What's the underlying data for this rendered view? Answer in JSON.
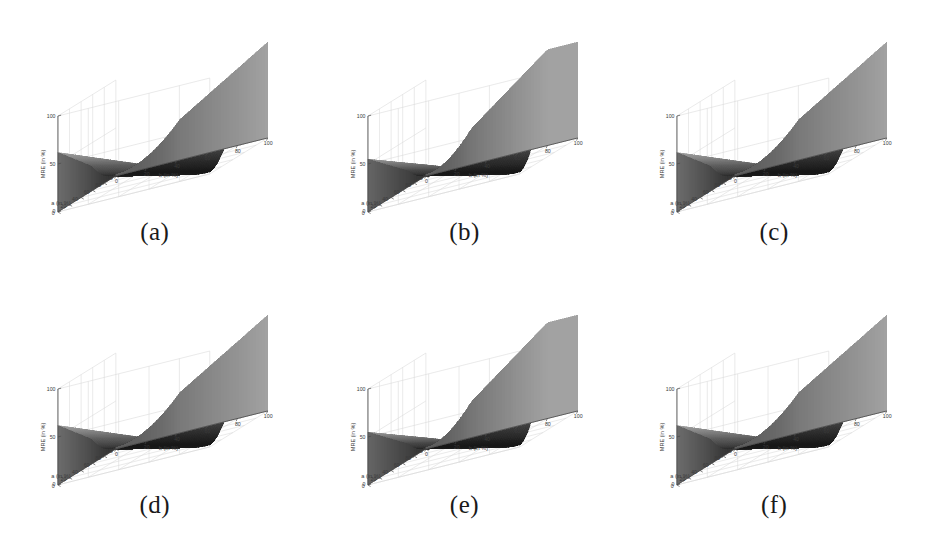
{
  "figure": {
    "background_color": "#ffffff",
    "panel_count": 6,
    "rows": 2,
    "columns": 3
  },
  "axes": {
    "z_label": "MRE (in %)",
    "x_label": "a (in %)",
    "y_label": "b (in %)",
    "z_ticks": [
      "0",
      "50",
      "100"
    ],
    "x_ticks": [
      "0",
      "20",
      "40",
      "60",
      "80",
      "100"
    ],
    "y_ticks": [
      "0",
      "20",
      "40",
      "60",
      "80",
      "100"
    ],
    "grid_color": "#d8d8d8",
    "axis_color": "#4a4a4a"
  },
  "panels": [
    {
      "caption": "(a)",
      "shape": "single-valley"
    },
    {
      "caption": "(b)",
      "shape": "v-valley-ridge"
    },
    {
      "caption": "(c)",
      "shape": "single-valley"
    },
    {
      "caption": "(d)",
      "shape": "single-valley"
    },
    {
      "caption": "(e)",
      "shape": "v-valley-ridge"
    },
    {
      "caption": "(f)",
      "shape": "single-valley"
    }
  ],
  "chart_data": {
    "type": "surface",
    "title": "",
    "xlabel": "a (in %)",
    "ylabel": "b (in %)",
    "zlabel": "MRE (in %)",
    "xlim": [
      0,
      100
    ],
    "ylim": [
      0,
      100
    ],
    "zlim": [
      0,
      100
    ],
    "grid": true,
    "legend": "none",
    "colormap": "grayscale",
    "series": [
      {
        "name": "(a)",
        "shape": "single-valley",
        "z_at_corners": {
          "a0_b0": 100,
          "a0_b100": 45,
          "a100_b0": 0,
          "a100_b100": 55
        },
        "valley_line": "a approximately equals b, MRE near 0"
      },
      {
        "name": "(b)",
        "shape": "v-valley-ridge",
        "z_at_corners": {
          "a0_b0": 100,
          "a0_b100": 100,
          "a100_b0": 0,
          "a100_b100": 45
        },
        "valley_line": "steep V-shaped trough along a approximately equals b with a high ridge at large b"
      },
      {
        "name": "(c)",
        "shape": "single-valley",
        "z_at_corners": {
          "a0_b0": 100,
          "a0_b100": 45,
          "a100_b0": 0,
          "a100_b100": 55
        },
        "valley_line": "a approximately equals b, MRE near 0"
      },
      {
        "name": "(d)",
        "shape": "single-valley",
        "z_at_corners": {
          "a0_b0": 100,
          "a0_b100": 45,
          "a100_b0": 0,
          "a100_b100": 55
        },
        "valley_line": "a approximately equals b, MRE near 0"
      },
      {
        "name": "(e)",
        "shape": "v-valley-ridge",
        "z_at_corners": {
          "a0_b0": 100,
          "a0_b100": 100,
          "a100_b0": 0,
          "a100_b100": 45
        },
        "valley_line": "steep V-shaped trough along a approximately equals b with a high ridge at large b"
      },
      {
        "name": "(f)",
        "shape": "single-valley",
        "z_at_corners": {
          "a0_b0": 100,
          "a0_b100": 45,
          "a100_b0": 0,
          "a100_b100": 55
        },
        "valley_line": "a approximately equals b, MRE near 0"
      }
    ]
  }
}
